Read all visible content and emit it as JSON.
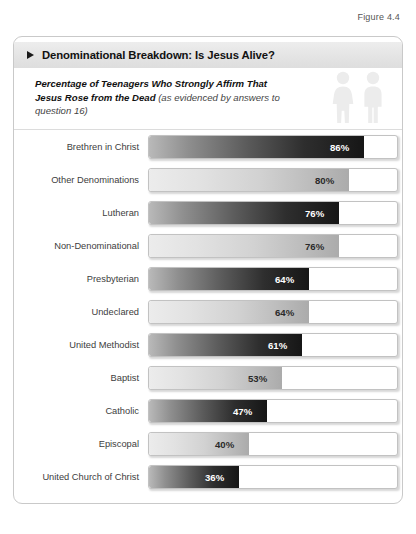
{
  "figure": {
    "caption": "Figure 4.4"
  },
  "card": {
    "title": "Denominational Breakdown: Is Jesus Alive?",
    "title_marker_icon": "triangle-right-icon",
    "subtitle_strong": "Percentage of Teenagers Who Strongly Affirm That Jesus Rose from the Dead ",
    "subtitle_paren": "(as evidenced by answers to question 16)",
    "decoration_icons": [
      "female-figure-icon",
      "male-figure-icon"
    ]
  },
  "chart_data": {
    "type": "bar",
    "orientation": "horizontal",
    "title": "Denominational Breakdown: Is Jesus Alive?",
    "subtitle": "Percentage of Teenagers Who Strongly Affirm That Jesus Rose from the Dead (as evidenced by answers to question 16)",
    "xlabel": "",
    "ylabel": "",
    "xlim": [
      0,
      100
    ],
    "unit": "%",
    "grid": false,
    "legend": false,
    "categories": [
      "Brethren in Christ",
      "Other Denominations",
      "Lutheran",
      "Non-Denominational",
      "Presbyterian",
      "Undeclared",
      "United Methodist",
      "Baptist",
      "Catholic",
      "Episcopal",
      "United Church of Christ"
    ],
    "values": [
      86,
      80,
      76,
      76,
      64,
      64,
      61,
      53,
      47,
      40,
      36
    ],
    "value_labels": [
      "86%",
      "80%",
      "76%",
      "76%",
      "64%",
      "64%",
      "61%",
      "53%",
      "47%",
      "40%",
      "36%"
    ],
    "bar_styles": [
      "dark",
      "light",
      "dark",
      "light",
      "dark",
      "light",
      "dark",
      "light",
      "dark",
      "light",
      "dark"
    ]
  },
  "colors": {
    "card_border": "#c9c9c9",
    "header_band": "#e6e6e6",
    "dark_bar_end": "#161616",
    "light_bar_end": "#ababab",
    "label_text": "#3d3d3d",
    "icon_fill": "#ececec"
  }
}
